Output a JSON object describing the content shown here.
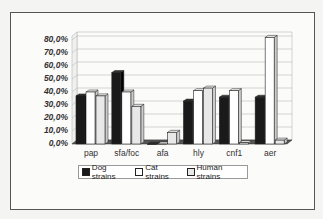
{
  "chart_data": {
    "type": "bar",
    "title": "",
    "xlabel": "",
    "ylabel": "",
    "categories": [
      "pap",
      "sfa/foc",
      "afa",
      "hly",
      "cnf1",
      "aer"
    ],
    "series": [
      {
        "name": "Dog strains",
        "color": "#1a1a1a",
        "values": [
          37,
          55,
          0,
          33,
          36,
          36
        ]
      },
      {
        "name": "Cat strains",
        "color": "#ffffff",
        "values": [
          40,
          40,
          0,
          41,
          41,
          82
        ]
      },
      {
        "name": "Human strains",
        "color": "#e8e8e8",
        "values": [
          37,
          29,
          9,
          43,
          1,
          3
        ]
      }
    ],
    "yticks": [
      "0,0%",
      "10,0%",
      "20,0%",
      "30,0%",
      "40,0%",
      "50,0%",
      "60,0%",
      "70,0%",
      "80,0%"
    ],
    "ylim": [
      0,
      80
    ],
    "grid": true,
    "legend_position": "bottom",
    "style": "3d-clustered-column"
  },
  "legend": {
    "items": [
      {
        "label": "Dog strains"
      },
      {
        "label": "Cat strains"
      },
      {
        "label": "Human strains"
      }
    ]
  }
}
